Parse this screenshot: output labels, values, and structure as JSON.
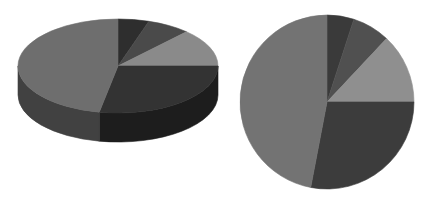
{
  "figure": {
    "background_color": "#ffffff",
    "width": 434,
    "height": 210,
    "title": "",
    "panel_count": 2
  },
  "chart_data": [
    {
      "type": "pie",
      "name": "left-pie-3d",
      "title": "",
      "subtitle": "",
      "xlabel": "",
      "ylabel": "",
      "legend": "none",
      "grid": false,
      "three_d": true,
      "labels": [
        "A",
        "B",
        "C",
        "D",
        "E"
      ],
      "values": [
        5,
        7,
        13,
        28,
        47
      ],
      "percentages": [
        5,
        7,
        13,
        28,
        47
      ],
      "start_angle_deg": 0,
      "direction": "clockwise",
      "colors": [
        "#2e2e2e",
        "#4a4a4a",
        "#8a8a8a",
        "#333333",
        "#6e6e6e"
      ],
      "side_colors": [
        "#1a1a1a",
        "#2a2a2a",
        "#545454",
        "#1d1d1d",
        "#414141"
      ],
      "center_x": 118,
      "center_y": 66,
      "radius_x": 100,
      "radius_y": 47,
      "depth": 29
    },
    {
      "type": "pie",
      "name": "right-pie-2d",
      "title": "",
      "subtitle": "",
      "xlabel": "",
      "ylabel": "",
      "legend": "none",
      "grid": false,
      "three_d": false,
      "labels": [
        "A",
        "B",
        "C",
        "D",
        "E"
      ],
      "values": [
        5,
        7,
        13,
        28,
        47
      ],
      "percentages": [
        5,
        7,
        13,
        28,
        47
      ],
      "start_angle_deg": 0,
      "direction": "clockwise",
      "colors": [
        "#3a3a3a",
        "#505050",
        "#8f8f8f",
        "#3c3c3c",
        "#737373"
      ],
      "center_x": 327,
      "center_y": 102,
      "radius": 87
    }
  ]
}
